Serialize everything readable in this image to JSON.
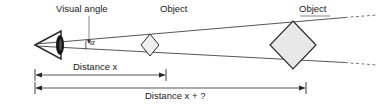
{
  "figure": {
    "type": "diagram",
    "background_color": "#ffffff",
    "line_color": "#2b2b2b",
    "fill_color": "#e8e8e8",
    "text_color": "#1a1a1a"
  },
  "labels": {
    "visual_angle": "Visual angle",
    "object_near": "Object",
    "object_far": "Object",
    "angle_symbol": "α",
    "distance_x": "Distance x",
    "distance_x_plus": "Distance x + ?"
  },
  "elements": {
    "eye": {
      "name": "eye",
      "apex_x": 35,
      "apex_y": 45
    },
    "object_near": {
      "name": "small-diamond",
      "center_x": 150,
      "center_y": 45,
      "half_width": 9,
      "half_height": 11
    },
    "object_far": {
      "name": "large-diamond",
      "center_x": 293,
      "center_y": 45,
      "half_width": 23,
      "half_height": 24
    },
    "ray_upper": {
      "from_x": 36,
      "from_y": 44,
      "to_x": 345,
      "to_y": 18
    },
    "ray_lower": {
      "from_x": 36,
      "from_y": 46,
      "to_x": 345,
      "to_y": 62
    },
    "dimension_near": {
      "y": 75,
      "x_start": 35,
      "x_end": 166
    },
    "dimension_far": {
      "y": 88,
      "x_start": 35,
      "x_end": 306
    }
  }
}
